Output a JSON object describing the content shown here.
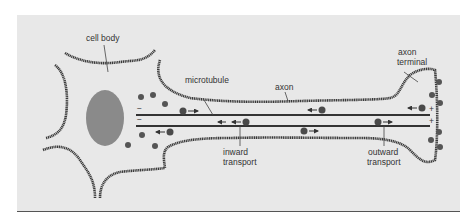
{
  "diagram": {
    "colors": {
      "background": "#e8e8e8",
      "membrane": "#3a3a3a",
      "nucleus": "#8a8a8a",
      "microtubule": "#333333",
      "vesicle": "#4a4a4a",
      "label": "#333333"
    },
    "labels": {
      "cell_body": "cell body",
      "microtubule": "microtubule",
      "axon": "axon",
      "axon_terminal_line1": "axon",
      "axon_terminal_line2": "terminal",
      "inward_line1": "inward",
      "inward_line2": "transport",
      "outward_line1": "outward",
      "outward_line2": "transport"
    },
    "polarity": {
      "minus_end": "−",
      "plus_end": "+"
    },
    "icons": [
      "vesicle-dot",
      "arrow-left",
      "arrow-right"
    ]
  }
}
